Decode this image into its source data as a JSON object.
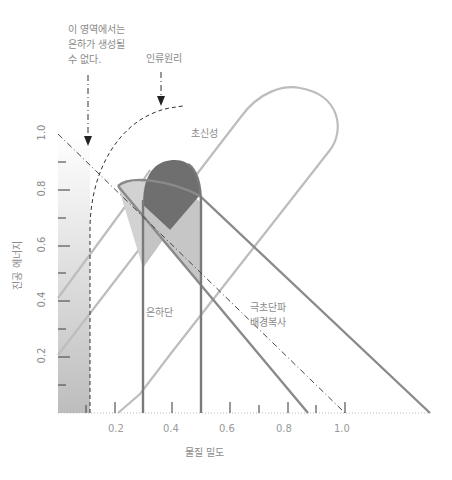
{
  "annotations": {
    "no_galaxy_line1": "이 영역에서는",
    "no_galaxy_line2": "은하가 생성될",
    "no_galaxy_line3": "수 없다.",
    "anthropic": "인류원리",
    "supernova": "초신성",
    "galaxy_cluster": "은하단",
    "cmb_line1": "극초단파",
    "cmb_line2": "배경복사"
  },
  "axes": {
    "x_label": "물질 밀도",
    "y_label": "진공 에너지",
    "x_ticks": [
      "0.2",
      "0.4",
      "0.6",
      "0.8",
      "1.0"
    ],
    "y_ticks": [
      "0.2",
      "0.4",
      "0.6",
      "0.8",
      "1.0"
    ]
  },
  "colors": {
    "supernova_contour": "#b8b8b8",
    "cluster_contour": "#7a7a7a",
    "cmb_band": "#8a8a8a",
    "overlap_dark": "#6f6f6f",
    "overlap_light": "#c9c9c9",
    "text": "#8a8a8a"
  }
}
